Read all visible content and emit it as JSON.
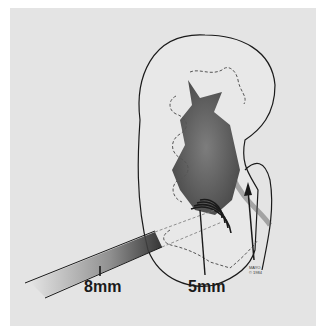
{
  "figure": {
    "labels": {
      "tract_diameter": "8mm",
      "inner_diameter": "5mm"
    },
    "credit": {
      "line1": "MAYO",
      "line2": "© 1984"
    },
    "colors": {
      "background": "#e4e4e4",
      "ink": "#1a1a1a"
    }
  }
}
